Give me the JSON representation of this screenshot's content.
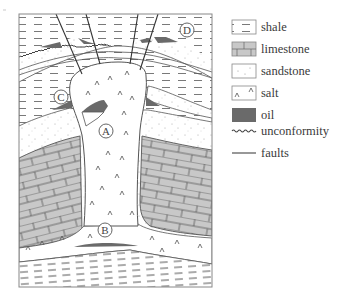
{
  "diagram": {
    "labels": [
      {
        "id": "A",
        "text": "A",
        "x": 106,
        "y": 131
      },
      {
        "id": "B",
        "text": "B",
        "x": 105,
        "y": 230
      },
      {
        "id": "C",
        "text": "C",
        "x": 61,
        "y": 97
      },
      {
        "id": "D",
        "text": "D",
        "x": 187,
        "y": 30
      }
    ]
  },
  "legend": {
    "items": [
      {
        "key": "shale",
        "label": "shale",
        "y": 20
      },
      {
        "key": "limestone",
        "label": "limestone",
        "y": 42
      },
      {
        "key": "sandstone",
        "label": "sandstone",
        "y": 64
      },
      {
        "key": "salt",
        "label": "salt",
        "y": 86
      },
      {
        "key": "oil",
        "label": "oil",
        "y": 108
      },
      {
        "key": "unconformity",
        "label": "unconformity",
        "y": 131
      },
      {
        "key": "faults",
        "label": "faults",
        "y": 152
      }
    ]
  },
  "colors": {
    "outline": "#555555",
    "limestone": "#c8c8c8",
    "oil": "#6a6a6a",
    "sandstone_dot": "#a8a8a8",
    "shale_dash": "#666666",
    "background": "#ffffff"
  }
}
